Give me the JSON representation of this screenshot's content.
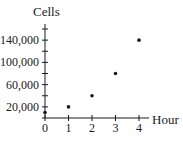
{
  "chart_data": {
    "type": "scatter",
    "title": "",
    "xlabel": "Hour",
    "ylabel": "Cells",
    "x": [
      0,
      1,
      2,
      3,
      4
    ],
    "series": [
      {
        "name": "Cells",
        "values": [
          10000,
          20000,
          40000,
          80000,
          140000
        ]
      }
    ],
    "x_ticks": [
      0,
      1,
      2,
      3,
      4
    ],
    "x_tick_labels": [
      "0",
      "1",
      "2",
      "3",
      "4"
    ],
    "y_ticks": [
      20000,
      40000,
      60000,
      80000,
      100000,
      120000,
      140000,
      160000
    ],
    "y_tick_labels": [
      "20,000",
      "60,000",
      "100,000",
      "140,000"
    ],
    "y_labeled_ticks": [
      20000,
      60000,
      100000,
      140000
    ],
    "xlim": [
      0,
      4
    ],
    "ylim": [
      0,
      160000
    ],
    "grid": false,
    "legend": "none",
    "colors": {
      "axis": "#1a1a1a",
      "point": "#1a1a1a",
      "background": "#ffffff"
    }
  }
}
